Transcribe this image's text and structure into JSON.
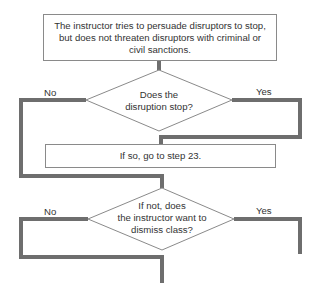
{
  "flowchart": {
    "step_box": {
      "text": "The instructor tries to persuade disruptors to stop, but does not threaten disruptors with criminal or civil sanctions."
    },
    "decision_1": {
      "text_line1": "Does the",
      "text_line2": "disruption stop?",
      "no_label": "No",
      "yes_label": "Yes"
    },
    "result_box": {
      "text": "If so, go to step 23."
    },
    "decision_2": {
      "text_line1": "If not, does",
      "text_line2": "the instructor want to",
      "text_line3": "dismiss class?",
      "no_label": "No",
      "yes_label": "Yes"
    },
    "colors": {
      "connector": "#6e6e6e",
      "outline": "#8a8a8a",
      "text": "#333333"
    }
  }
}
